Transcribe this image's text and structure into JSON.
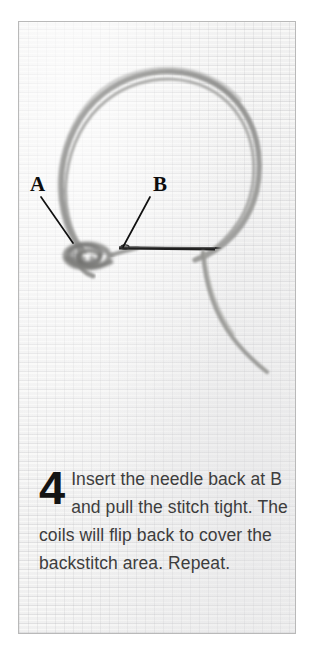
{
  "page": {
    "background_color": "#ffffff",
    "width": 312,
    "height": 657
  },
  "photo": {
    "alt": "Close-up photograph of white aida cross-stitch fabric with a large grey thread loop, a coiled wrap at point A and a sewing needle passing through point B",
    "border_color": "#b9b9b9",
    "fabric_color": "#f8f8f7",
    "thread_color": "#8f8f8d",
    "needle_color": "#242424",
    "labels": [
      {
        "id": "label-a",
        "text": "A",
        "x": 29,
        "y": 174,
        "leader_from": [
          40,
          196
        ],
        "leader_to": [
          72,
          242
        ]
      },
      {
        "id": "label-b",
        "text": "B",
        "x": 152,
        "y": 174,
        "leader_from": [
          149,
          196
        ],
        "leader_to": [
          122,
          246
        ]
      }
    ]
  },
  "caption": {
    "step_number": "4",
    "text": "Insert the needle back at B and pull the stitch tight. The coils will flip back to cover the backstitch area. Repeat.",
    "lines": [
      "Insert the needle back",
      "at B and pull the stitch",
      "tight. The coils will flip back",
      "to cover the backstitch",
      "area. Repeat."
    ],
    "text_color": "#3d3d3d",
    "number_color": "#141414"
  }
}
